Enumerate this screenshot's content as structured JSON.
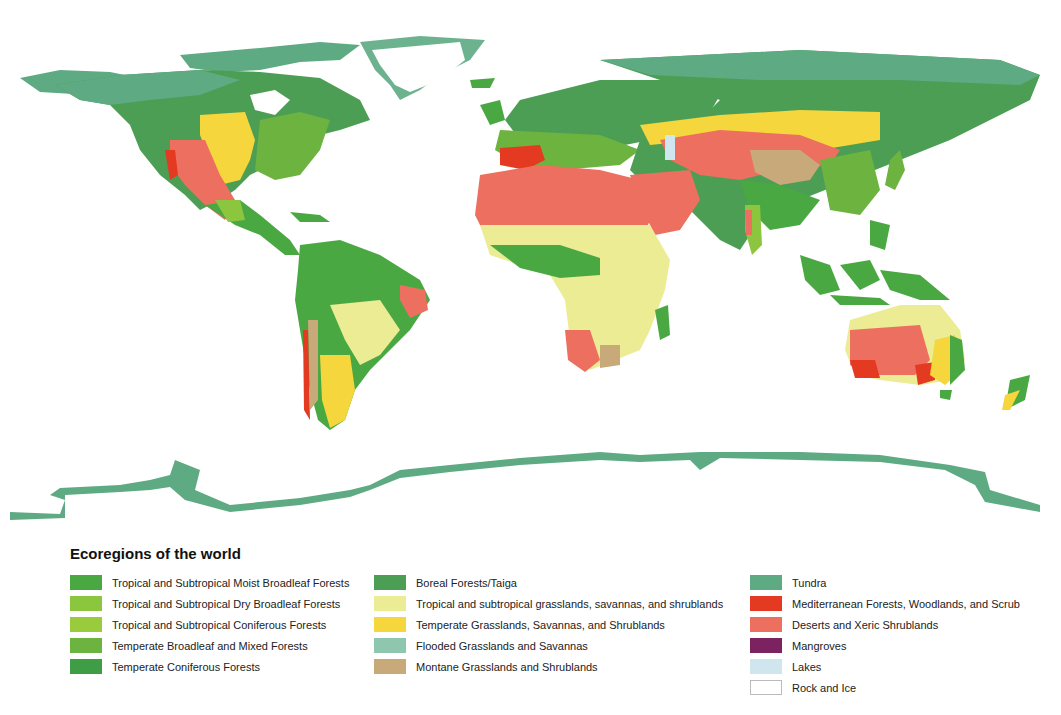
{
  "legend": {
    "title": "Ecoregions of the world",
    "columns": [
      [
        {
          "label": "Tropical and Subtropical Moist Broadleaf Forests",
          "color": "#4aa843",
          "key": "trop_moist"
        },
        {
          "label": "Tropical and Subtropical Dry Broadleaf Forests",
          "color": "#8cc63f",
          "key": "trop_dry"
        },
        {
          "label": "Tropical and Subtropical Coniferous Forests",
          "color": "#9acb3c",
          "key": "trop_conif"
        },
        {
          "label": "Temperate Broadleaf and Mixed Forests",
          "color": "#6db33f",
          "key": "temp_broad"
        },
        {
          "label": "Temperate Coniferous Forests",
          "color": "#3f9d45",
          "key": "temp_conif"
        }
      ],
      [
        {
          "label": "Boreal Forests/Taiga",
          "color": "#4c9e55",
          "key": "boreal"
        },
        {
          "label": "Tropical and subtropical grasslands, savannas, and shrublands",
          "color": "#ecec94",
          "key": "trop_grass"
        },
        {
          "label": "Temperate Grasslands, Savannas, and Shrublands",
          "color": "#f5d63d",
          "key": "temp_grass"
        },
        {
          "label": "Flooded Grasslands and Savannas",
          "color": "#8fc7ae",
          "key": "flooded"
        },
        {
          "label": "Montane Grasslands and Shrublands",
          "color": "#c8a97a",
          "key": "montane"
        }
      ],
      [
        {
          "label": "Tundra",
          "color": "#5daa83",
          "key": "tundra"
        },
        {
          "label": "Mediterranean Forests, Woodlands, and Scrub",
          "color": "#e53a22",
          "key": "med"
        },
        {
          "label": "Deserts and Xeric Shrublands",
          "color": "#ec6f5f",
          "key": "desert"
        },
        {
          "label": "Mangroves",
          "color": "#7d2260",
          "key": "mangroves"
        },
        {
          "label": "Lakes",
          "color": "#cfe6ef",
          "key": "lakes"
        },
        {
          "label": "Rock and Ice",
          "color": "#ffffff",
          "key": "rock_ice"
        }
      ]
    ]
  }
}
